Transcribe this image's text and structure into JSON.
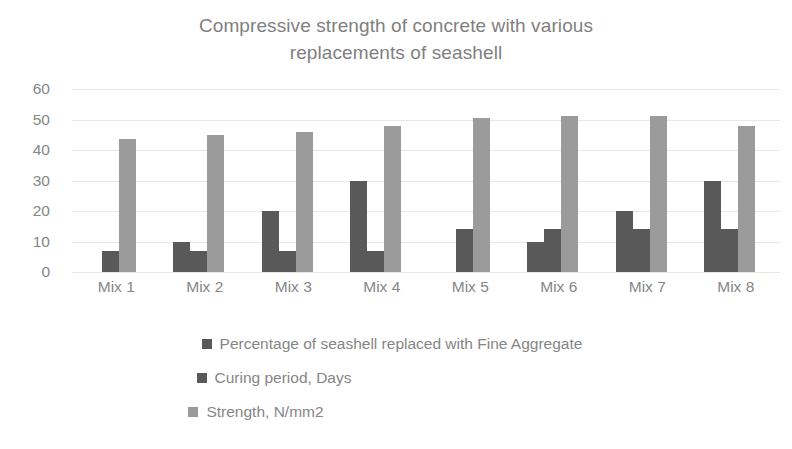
{
  "chart_data": {
    "type": "bar",
    "title": "Compressive strength of concrete with various\nreplacements of seashell",
    "xlabel": "",
    "ylabel": "",
    "ylim": [
      0,
      60
    ],
    "yticks": [
      0,
      10,
      20,
      30,
      40,
      50,
      60
    ],
    "grid": true,
    "legend_position": "bottom",
    "categories": [
      "Mix 1",
      "Mix 2",
      "Mix 3",
      "Mix 4",
      "Mix 5",
      "Mix 6",
      "Mix 7",
      "Mix 8"
    ],
    "series": [
      {
        "name": "Percentage of seashell replaced with Fine Aggregate",
        "color": "#595959",
        "values": [
          0,
          10,
          20,
          30,
          0,
          10,
          20,
          30
        ]
      },
      {
        "name": "Curing period, Days",
        "color": "#595959",
        "values": [
          7,
          7,
          7,
          7,
          14,
          14,
          14,
          14
        ]
      },
      {
        "name": "Strength, N/mm2",
        "color": "#9b9b9b",
        "values": [
          43.5,
          45,
          46,
          48,
          50.5,
          51,
          51,
          48
        ]
      }
    ]
  },
  "axis": {
    "y_tick_labels": [
      "60",
      "50",
      "40",
      "30",
      "20",
      "10",
      "0"
    ]
  },
  "legend": {
    "items": [
      {
        "label": "Percentage of seashell replaced with Fine Aggregate",
        "color": "#595959",
        "swatch_name": "legend-swatch-percentage"
      },
      {
        "label": "Curing period, Days",
        "color": "#595959",
        "swatch_name": "legend-swatch-curing"
      },
      {
        "label": "Strength, N/mm2",
        "color": "#9b9b9b",
        "swatch_name": "legend-swatch-strength"
      }
    ]
  }
}
